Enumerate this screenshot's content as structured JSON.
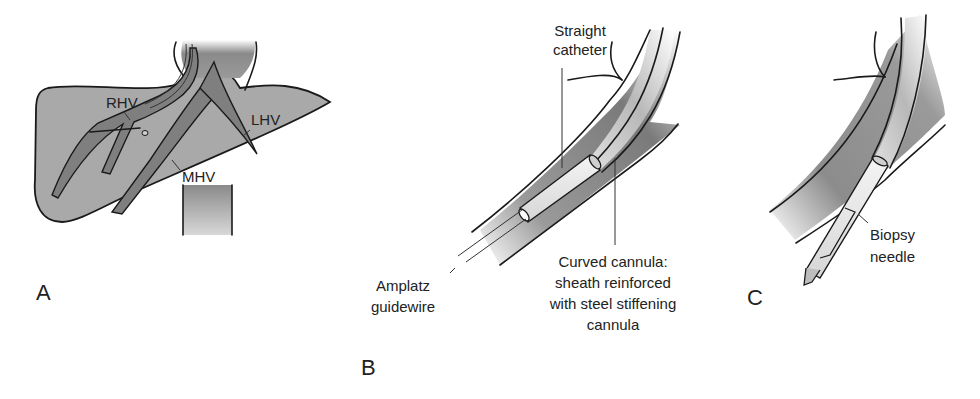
{
  "figure": {
    "panels": [
      {
        "id": "A",
        "label": "A",
        "description": "Liver with hepatic veins",
        "annotations": [
          "RHV",
          "MHV",
          "LHV"
        ]
      },
      {
        "id": "B",
        "label": "B",
        "annotations": {
          "straight_catheter": [
            "Straight",
            "catheter"
          ],
          "amplatz_guidewire": [
            "Amplatz",
            "guidewire"
          ],
          "curved_cannula": [
            "Curved cannula:",
            "sheath reinforced",
            "with steel stiffening",
            "cannula"
          ]
        }
      },
      {
        "id": "C",
        "label": "C",
        "annotations": {
          "biopsy_needle": [
            "Biopsy",
            "needle"
          ]
        }
      }
    ],
    "colors": {
      "liver_fill": "#a9a9a9",
      "vein_fill": "#7f7f7f",
      "outline": "#1a1a1a",
      "background": "#ffffff"
    }
  }
}
